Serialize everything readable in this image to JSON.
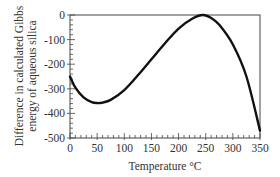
{
  "chart_data": {
    "type": "line",
    "title": "",
    "xlabel": "Temperature °C",
    "ylabel": [
      "Difference in calculated Gibbs",
      "energy of aqueous silica"
    ],
    "xlim": [
      0,
      350
    ],
    "ylim": [
      -500,
      0
    ],
    "xticks": [
      0,
      50,
      100,
      150,
      200,
      250,
      300,
      350
    ],
    "yticks": [
      0,
      -100,
      -200,
      -300,
      -400,
      -500
    ],
    "xminor_step": 10,
    "yminor_step": 20,
    "grid": false,
    "legend": null,
    "series": [
      {
        "name": "Gibbs energy difference",
        "color": "#111111",
        "x": [
          0,
          10,
          25,
          40,
          50,
          60,
          75,
          100,
          125,
          150,
          175,
          200,
          225,
          245,
          260,
          275,
          300,
          325,
          350
        ],
        "values": [
          -250,
          -295,
          -335,
          -354,
          -358,
          -356,
          -345,
          -305,
          -245,
          -180,
          -115,
          -55,
          -15,
          0,
          -12,
          -40,
          -120,
          -250,
          -470
        ]
      }
    ]
  }
}
